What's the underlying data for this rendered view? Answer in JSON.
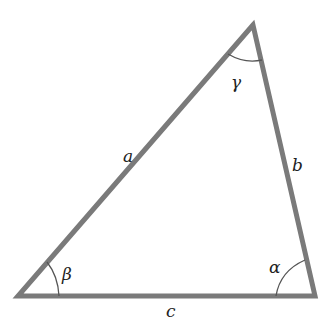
{
  "diagram": {
    "type": "triangle",
    "stroke_color": "#7a7a7a",
    "arc_color": "#555555",
    "text_color": "#222222",
    "vertices": {
      "top": [
        253,
        25
      ],
      "bottom_left": [
        18,
        296
      ],
      "bottom_right": [
        315,
        296
      ]
    },
    "sides": {
      "a": "a",
      "b": "b",
      "c": "c"
    },
    "angles": {
      "alpha": "α",
      "beta": "β",
      "gamma": "γ"
    }
  }
}
